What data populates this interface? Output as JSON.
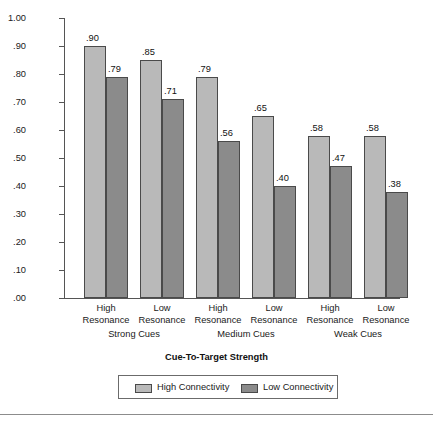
{
  "chart_data": {
    "type": "bar",
    "title": "",
    "xlabel": "Cue-To-Target Strength",
    "ylabel": "Probability off and Recall",
    "ylim": [
      0.0,
      1.0
    ],
    "ytick_labels": [
      "1.00",
      ".90",
      ".80",
      ".70",
      ".60",
      ".50",
      ".40",
      ".30",
      ".20",
      ".10",
      ".00"
    ],
    "ytick_values": [
      1.0,
      0.9,
      0.8,
      0.7,
      0.6,
      0.5,
      0.4,
      0.3,
      0.2,
      0.1,
      0.0
    ],
    "grid": false,
    "legend_position": "bottom",
    "categories": [
      "High Resonance",
      "Low Resonance",
      "High Resonance",
      "Low Resonance",
      "High Resonance",
      "Low Resonance"
    ],
    "category_lines": [
      [
        "High",
        "Resonance"
      ],
      [
        "Low",
        "Resonance"
      ],
      [
        "High",
        "Resonance"
      ],
      [
        "Low",
        "Resonance"
      ],
      [
        "High",
        "Resonance"
      ],
      [
        "Low",
        "Resonance"
      ]
    ],
    "groups": [
      {
        "label": "Strong Cues",
        "categories": [
          0,
          1
        ]
      },
      {
        "label": "Medium Cues",
        "categories": [
          2,
          3
        ]
      },
      {
        "label": "Weak Cues",
        "categories": [
          4,
          5
        ]
      }
    ],
    "series": [
      {
        "name": "High Connectivity",
        "color": "#b9b9b9",
        "values": [
          0.9,
          0.85,
          0.79,
          0.65,
          0.58,
          0.58
        ],
        "value_labels": [
          ".90",
          ".85",
          ".79",
          ".65",
          ".58",
          ".58"
        ]
      },
      {
        "name": "Low Connectivity",
        "color": "#8b8b8b",
        "values": [
          0.79,
          0.71,
          0.56,
          0.4,
          0.47,
          0.38
        ],
        "value_labels": [
          ".79",
          ".71",
          ".56",
          ".40",
          ".47",
          ".38"
        ]
      }
    ]
  },
  "colors": {
    "high_connectivity": "#b9b9b9",
    "low_connectivity": "#8b8b8b",
    "axis": "#555555",
    "bar_border": "#4a4a4a",
    "text": "#1a1a1a"
  }
}
